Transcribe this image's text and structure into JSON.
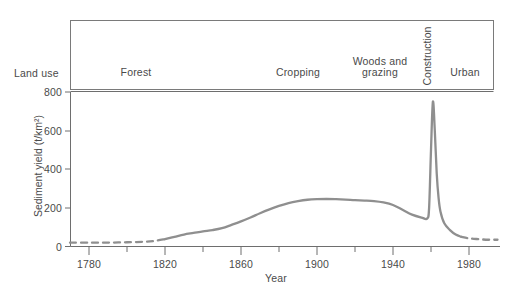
{
  "chart_data": {
    "type": "line",
    "title": "",
    "subtitle": "",
    "xlabel": "Year",
    "ylabel": "Sediment yield (t/km2)",
    "ylabel_display": "Sediment yield (t/km²)",
    "xlim": [
      1770,
      1995
    ],
    "ylim": [
      0,
      800
    ],
    "grid": false,
    "legend": "none",
    "x_ticks_major": [
      1780,
      1820,
      1860,
      1900,
      1940,
      1980
    ],
    "x_ticks_minor": [
      1800,
      1840,
      1880,
      1920,
      1960
    ],
    "y_ticks": [
      0,
      200,
      400,
      600,
      800
    ],
    "series": [
      {
        "name": "Sediment yield",
        "color": "#8f8f8f",
        "style": "mixed-dashed-solid",
        "x": [
          1770,
          1780,
          1790,
          1800,
          1810,
          1815,
          1820,
          1825,
          1830,
          1835,
          1840,
          1845,
          1850,
          1855,
          1860,
          1865,
          1870,
          1875,
          1880,
          1885,
          1890,
          1895,
          1900,
          1905,
          1910,
          1915,
          1920,
          1925,
          1930,
          1935,
          1940,
          1945,
          1950,
          1955,
          1958,
          1959,
          1960,
          1961,
          1962,
          1963,
          1964,
          1965,
          1967,
          1970,
          1973,
          1976,
          1980,
          1985,
          1990,
          1995
        ],
        "y": [
          20,
          20,
          20,
          22,
          25,
          30,
          38,
          50,
          62,
          70,
          78,
          85,
          95,
          112,
          130,
          150,
          172,
          192,
          210,
          225,
          235,
          242,
          245,
          246,
          245,
          243,
          240,
          238,
          235,
          228,
          215,
          190,
          165,
          150,
          145,
          200,
          500,
          750,
          600,
          380,
          250,
          180,
          120,
          85,
          62,
          50,
          42,
          38,
          35,
          35
        ]
      }
    ],
    "dashed_segments": [
      {
        "from": 1770,
        "to": 1824
      },
      {
        "from": 1978,
        "to": 1995
      }
    ],
    "peak": {
      "year": 1961,
      "value": 750
    },
    "plateau": {
      "years": [
        1885,
        1930
      ],
      "value": 245
    },
    "land_use_bands": [
      {
        "label": "Forest",
        "label_lines": [
          "Forest"
        ],
        "center_year": 1800,
        "orientation": "horizontal"
      },
      {
        "label": "Cropping",
        "label_lines": [
          "Cropping"
        ],
        "center_year": 1878,
        "orientation": "horizontal"
      },
      {
        "label": "Woods and grazing",
        "label_lines": [
          "Woods and",
          "grazing"
        ],
        "center_year": 1940,
        "orientation": "horizontal"
      },
      {
        "label": "Construction",
        "label_lines": [
          "Construction"
        ],
        "center_year": 1961,
        "orientation": "vertical"
      },
      {
        "label": "Urban",
        "label_lines": [
          "Urban"
        ],
        "center_year": 1979,
        "orientation": "horizontal"
      }
    ]
  },
  "labels": {
    "land_use_row_title": "Land use",
    "x_axis_title": "Year",
    "y_axis_title": "Sediment yield (t/km²)",
    "land_use_forest": "Forest",
    "land_use_cropping": "Cropping",
    "land_use_woods_line1": "Woods and",
    "land_use_woods_line2": "grazing",
    "land_use_construction": "Construction",
    "land_use_urban": "Urban",
    "y_tick_0": "0",
    "y_tick_200": "200",
    "y_tick_400": "400",
    "y_tick_600": "600",
    "y_tick_800": "800",
    "x_tick_1780": "1780",
    "x_tick_1820": "1820",
    "x_tick_1860": "1860",
    "x_tick_1900": "1900",
    "x_tick_1940": "1940",
    "x_tick_1980": "1980"
  },
  "colors": {
    "background": "#ffffff",
    "axis": "#6e6e6e",
    "curve": "#8f8f8f",
    "text": "#4a4a4a",
    "box": "#7a7a7a"
  }
}
